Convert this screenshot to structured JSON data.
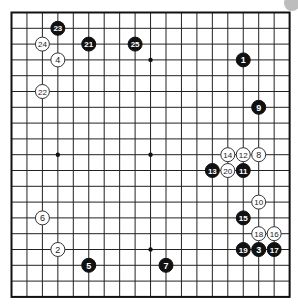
{
  "board": {
    "size": 19,
    "origin_x": 11.5,
    "origin_y": 12.5,
    "spacing_x": 15.45,
    "spacing_y": 15.8,
    "stone_radius": 7,
    "line_color": "#222222",
    "black_color": "#111111",
    "white_color": "#ffffff"
  },
  "hoshi": [
    {
      "col": 9,
      "row": 3
    },
    {
      "col": 3,
      "row": 9
    },
    {
      "col": 9,
      "row": 9
    },
    {
      "col": 9,
      "row": 15
    }
  ],
  "stones": [
    {
      "move": "1",
      "color": "black",
      "col": 15,
      "row": 3
    },
    {
      "move": "2",
      "color": "white",
      "col": 3,
      "row": 15
    },
    {
      "move": "3",
      "color": "black",
      "col": 16,
      "row": 15
    },
    {
      "move": "4",
      "color": "white",
      "col": 3,
      "row": 3
    },
    {
      "move": "5",
      "color": "black",
      "col": 5,
      "row": 16
    },
    {
      "move": "6",
      "color": "white",
      "col": 2,
      "row": 13
    },
    {
      "move": "7",
      "color": "black",
      "col": 10,
      "row": 16
    },
    {
      "move": "8",
      "color": "white",
      "col": 16,
      "row": 9
    },
    {
      "move": "9",
      "color": "black",
      "col": 16,
      "row": 6
    },
    {
      "move": "10",
      "color": "white",
      "col": 16,
      "row": 12
    },
    {
      "move": "11",
      "color": "black",
      "col": 15,
      "row": 10
    },
    {
      "move": "12",
      "color": "white",
      "col": 15,
      "row": 9
    },
    {
      "move": "13",
      "color": "black",
      "col": 13,
      "row": 10
    },
    {
      "move": "14",
      "color": "white",
      "col": 14,
      "row": 9
    },
    {
      "move": "15",
      "color": "black",
      "col": 15,
      "row": 13
    },
    {
      "move": "16",
      "color": "white",
      "col": 17,
      "row": 14
    },
    {
      "move": "17",
      "color": "black",
      "col": 17,
      "row": 15
    },
    {
      "move": "18",
      "color": "white",
      "col": 16,
      "row": 14
    },
    {
      "move": "19",
      "color": "black",
      "col": 15,
      "row": 15
    },
    {
      "move": "20",
      "color": "white",
      "col": 14,
      "row": 10
    },
    {
      "move": "21",
      "color": "black",
      "col": 5,
      "row": 2
    },
    {
      "move": "22",
      "color": "white",
      "col": 2,
      "row": 5
    },
    {
      "move": "23",
      "color": "black",
      "col": 3,
      "row": 1
    },
    {
      "move": "24",
      "color": "white",
      "col": 2,
      "row": 2
    },
    {
      "move": "25",
      "color": "black",
      "col": 8,
      "row": 2
    }
  ],
  "corner_indicator": {
    "color": "#bdbdbd",
    "cx": 292,
    "cy": 3,
    "r": 8
  }
}
